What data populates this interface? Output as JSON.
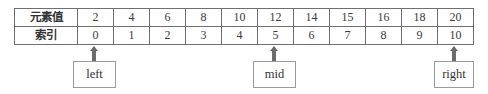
{
  "table": {
    "row_headers": [
      "元素值",
      "索引"
    ],
    "values": [
      "2",
      "4",
      "6",
      "8",
      "10",
      "12",
      "14",
      "15",
      "16",
      "18",
      "20"
    ],
    "indices": [
      "0",
      "1",
      "2",
      "3",
      "4",
      "5",
      "6",
      "7",
      "8",
      "9",
      "10"
    ]
  },
  "pointers": [
    {
      "label": "left",
      "index": 0
    },
    {
      "label": "mid",
      "index": 5
    },
    {
      "label": "right",
      "index": 10
    }
  ],
  "colors": {
    "border": "#6f6f6f",
    "arrow": "#6b6b6b",
    "box_border": "#9a9a9a"
  }
}
